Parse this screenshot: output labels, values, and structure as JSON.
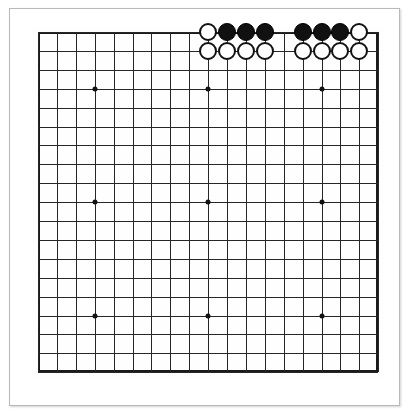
{
  "app": {
    "title": "Go Board Diagram",
    "background_color": "#ffffff"
  },
  "frame": {
    "name": "paper-frame",
    "border_color": "#b9b9b9",
    "fill_color": "#ffffff"
  },
  "board": {
    "label": "Go board",
    "size": 19,
    "columns": 19,
    "rows": 19,
    "origin_x": 38,
    "origin_y": 32,
    "spacing": 18.9,
    "line_color": "#262626",
    "border_color": "#1a1a1a",
    "surface_color": "#fefefe",
    "star_point_color": "#111111",
    "star_point_lines": [
      3,
      9,
      15
    ],
    "column_labels": [
      "A",
      "B",
      "C",
      "D",
      "E",
      "F",
      "G",
      "H",
      "J",
      "K",
      "L",
      "M",
      "N",
      "O",
      "P",
      "Q",
      "R",
      "S",
      "T"
    ],
    "row_labels": [
      "19",
      "18",
      "17",
      "16",
      "15",
      "14",
      "13",
      "12",
      "11",
      "10",
      "9",
      "8",
      "7",
      "6",
      "5",
      "4",
      "3",
      "2",
      "1"
    ]
  },
  "stones": {
    "black_color": "#111111",
    "white_color": "#ffffff",
    "white_outline_color": "#121212",
    "radius": 9.2,
    "black_count": 6,
    "white_count": 10,
    "total_count": 16,
    "list": [
      {
        "color": "white",
        "col": 9,
        "row": 0,
        "label": "K19"
      },
      {
        "color": "black",
        "col": 10,
        "row": 0,
        "label": "L19"
      },
      {
        "color": "black",
        "col": 11,
        "row": 0,
        "label": "M19"
      },
      {
        "color": "black",
        "col": 12,
        "row": 0,
        "label": "N19"
      },
      {
        "color": "black",
        "col": 14,
        "row": 0,
        "label": "P19"
      },
      {
        "color": "black",
        "col": 15,
        "row": 0,
        "label": "Q19"
      },
      {
        "color": "black",
        "col": 16,
        "row": 0,
        "label": "R19"
      },
      {
        "color": "white",
        "col": 17,
        "row": 0,
        "label": "S19"
      },
      {
        "color": "white",
        "col": 9,
        "row": 1,
        "label": "K18"
      },
      {
        "color": "white",
        "col": 10,
        "row": 1,
        "label": "L18"
      },
      {
        "color": "white",
        "col": 11,
        "row": 1,
        "label": "M18"
      },
      {
        "color": "white",
        "col": 12,
        "row": 1,
        "label": "N18"
      },
      {
        "color": "white",
        "col": 14,
        "row": 1,
        "label": "P18"
      },
      {
        "color": "white",
        "col": 15,
        "row": 1,
        "label": "Q18"
      },
      {
        "color": "white",
        "col": 16,
        "row": 1,
        "label": "R18"
      },
      {
        "color": "white",
        "col": 17,
        "row": 1,
        "label": "S18"
      }
    ],
    "empty_points_in_group": [
      {
        "col": 13,
        "row": 0,
        "label": "O19"
      },
      {
        "col": 13,
        "row": 1,
        "label": "O18"
      }
    ]
  }
}
